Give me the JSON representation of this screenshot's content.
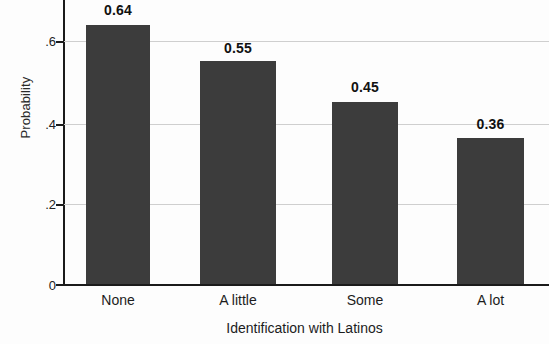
{
  "chart_data": {
    "type": "bar",
    "title": "",
    "subtitle": "",
    "xlabel": "Identification with Latinos",
    "ylabel": "Probability",
    "categories": [
      "None",
      "A little",
      "Some",
      "A lot"
    ],
    "values": [
      0.64,
      0.55,
      0.45,
      0.36
    ],
    "value_labels": [
      "0.64",
      "0.55",
      "0.45",
      "0.36"
    ],
    "series": [
      {
        "name": "Probability",
        "values": [
          0.64,
          0.55,
          0.45,
          0.36
        ]
      }
    ],
    "ylim": [
      0,
      0.7
    ],
    "yticks": [
      0,
      0.2,
      0.4,
      0.6
    ],
    "ytick_labels": [
      "0",
      ".2",
      ".4",
      ".6"
    ],
    "grid": true,
    "grid_axis": "y",
    "legend": false,
    "legend_position": "none",
    "bar_color": "#3c3c3c",
    "gridline_color": "#cfcfcf",
    "axis_color": "#1b1b1b",
    "background_color": "#fdfdfd"
  }
}
